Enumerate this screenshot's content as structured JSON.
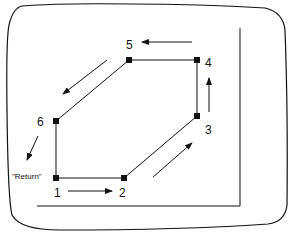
{
  "diagram": {
    "type": "robot path program on screen",
    "points": [
      {
        "id": "1",
        "label": "1",
        "x": 56,
        "y": 178
      },
      {
        "id": "2",
        "label": "2",
        "x": 124,
        "y": 178
      },
      {
        "id": "3",
        "label": "3",
        "x": 197,
        "y": 116
      },
      {
        "id": "4",
        "label": "4",
        "x": 197,
        "y": 60
      },
      {
        "id": "5",
        "label": "5",
        "x": 129,
        "y": 60
      },
      {
        "id": "6",
        "label": "6",
        "x": 56,
        "y": 121
      }
    ],
    "return_label": "\"Return\"",
    "path_order": [
      "1",
      "2",
      "3",
      "4",
      "5",
      "6",
      "1"
    ],
    "colors": {
      "line": "#111111",
      "background": "#ffffff"
    }
  }
}
